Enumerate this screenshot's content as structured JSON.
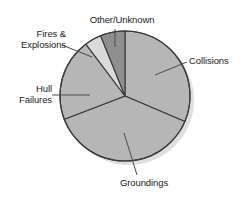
{
  "chart_data": {
    "type": "pie",
    "title": "",
    "subtitle": "",
    "xlabel": "",
    "ylabel": "",
    "legend_position": "callout-labels",
    "grid": false,
    "categories": [
      "Collisions",
      "Groundings",
      "Hull Failures",
      "Fires & Explosions",
      "Other/Unknown"
    ],
    "values": [
      31,
      38,
      15,
      9,
      6
    ],
    "units": "percent",
    "series": [
      {
        "name": "Causes of total loss",
        "values": [
          31,
          38,
          15,
          9,
          6
        ]
      }
    ],
    "slices": [
      {
        "label": "Collisions",
        "value": 31,
        "start_angle_deg": 90,
        "end_angle_deg": -23,
        "color": "#b6b6b6"
      },
      {
        "label": "Groundings",
        "value": 38,
        "start_angle_deg": -23,
        "end_angle_deg": -159,
        "color": "#b6b6b6"
      },
      {
        "label": "Hull Failures",
        "value": 15,
        "start_angle_deg": 201,
        "end_angle_deg": 127,
        "color": "#b6b6b6"
      },
      {
        "label": "Fires & Explosions",
        "value": 9,
        "start_angle_deg": 127,
        "end_angle_deg": 112,
        "color": "#dadada"
      },
      {
        "label": "Other/Unknown",
        "value": 6,
        "start_angle_deg": 112,
        "end_angle_deg": 90,
        "color": "#8f8f8f"
      }
    ],
    "colors": {
      "slice_default": "#b6b6b6",
      "slice_light": "#dadada",
      "slice_dark": "#8f8f8f",
      "outline": "#3a3a3a",
      "leader_line": "#4a4a4a",
      "shadow": "#d0d0d0",
      "text": "#1c1c1c",
      "background": "#ffffff"
    }
  },
  "labels": {
    "other_unknown": "Other/Unknown",
    "collisions": "Collisions",
    "groundings": "Groundings",
    "hull_line1": "Hull",
    "hull_line2": "Failures",
    "fires_line1": "Fires &",
    "fires_line2": "Explosions"
  },
  "artifacts": {
    "top_cropped_text": " "
  }
}
